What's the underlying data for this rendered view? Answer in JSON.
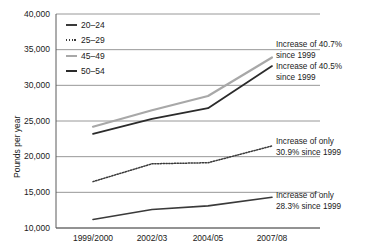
{
  "chart_data": {
    "type": "line",
    "title": "",
    "xlabel": "",
    "ylabel": "Pounds per year",
    "categories": [
      "1999/2000",
      "2002/03",
      "2004/05",
      "2007/08"
    ],
    "ylim": [
      10000,
      40000
    ],
    "ytick_labels": [
      "40,000",
      "35,000",
      "30,000",
      "25,000",
      "20,000",
      "15,000",
      "10,000"
    ],
    "ytick_values": [
      40000,
      35000,
      30000,
      25000,
      20000,
      15000,
      10000
    ],
    "grid": true,
    "legend_position": "top-left inside plot",
    "series": [
      {
        "name": "20–24",
        "style": "solid",
        "color": "#3a3a3a",
        "width": 1.6,
        "values": [
          11200,
          12600,
          13100,
          14300
        ]
      },
      {
        "name": "25–29",
        "style": "dotted",
        "color": "#3a3a3a",
        "width": 1.5,
        "values": [
          16500,
          19000,
          19150,
          21500
        ]
      },
      {
        "name": "45–49",
        "style": "solid",
        "color": "#a8a8a8",
        "width": 2.2,
        "values": [
          24200,
          26500,
          28500,
          33900
        ]
      },
      {
        "name": "50–54",
        "style": "solid",
        "color": "#2b2b2b",
        "width": 1.8,
        "values": [
          23200,
          25300,
          26800,
          32700
        ]
      }
    ],
    "annotations": [
      {
        "id": "annot-45-49",
        "text": "Increase of 40.7%\nsince 1999",
        "target_series": "45–49"
      },
      {
        "id": "annot-50-54",
        "text": "Increase of 40.5%\nsince 1999",
        "target_series": "50–54"
      },
      {
        "id": "annot-25-29",
        "text": "Increase of only\n30.9% since 1999",
        "target_series": "25–29"
      },
      {
        "id": "annot-20-24",
        "text": "Increase of only\n28.3% since 1999",
        "target_series": "20–24"
      }
    ],
    "colors": {
      "grid": "#8c8c8c",
      "axis": "#5a5a5a",
      "text": "#1a1a1a",
      "series_light": "#a8a8a8",
      "series_dark": "#2b2b2b"
    }
  }
}
